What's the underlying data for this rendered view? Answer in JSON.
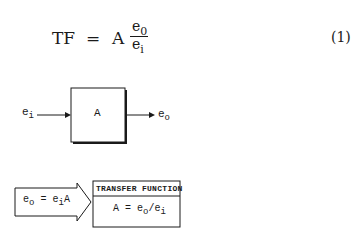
{
  "equation": {
    "lhs": "TF",
    "equals": "=",
    "coef": "A",
    "num_base": "e",
    "num_sub": "0",
    "den_base": "e",
    "den_sub": "i",
    "number": "(1)"
  },
  "block_diagram": {
    "input_base": "e",
    "input_sub": "i",
    "block_label": "A",
    "output_base": "e",
    "output_sub": "o"
  },
  "relation": {
    "lhs_base": "e",
    "lhs_sub": "o",
    "equals": "=",
    "rhs_base": "e",
    "rhs_sub": "i",
    "rhs_coef": "A"
  },
  "transfer_box": {
    "title": "TRANSFER FUNCTION",
    "formula_lhs": "A = e",
    "formula_sub1": "o",
    "formula_slash": "/e",
    "formula_sub2": "i"
  },
  "colors": {
    "ink": "#1a1a1a",
    "background": "#ffffff"
  }
}
